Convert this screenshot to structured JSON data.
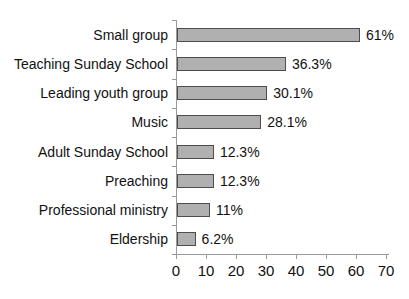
{
  "chart_data": {
    "type": "bar",
    "orientation": "horizontal",
    "title": "",
    "xlabel": "",
    "ylabel": "",
    "categories": [
      "Small group",
      "Teaching Sunday School",
      "Leading youth group",
      "Music",
      "Adult Sunday School",
      "Preaching",
      "Professional ministry",
      "Eldership"
    ],
    "values": [
      61,
      36.3,
      30.1,
      28.1,
      12.3,
      12.3,
      11,
      6.2
    ],
    "value_labels": [
      "61%",
      "36.3%",
      "30.1%",
      "28.1%",
      "12.3%",
      "12.3%",
      "11%",
      "6.2%"
    ],
    "x_ticks": [
      "0",
      "10",
      "20",
      "30",
      "40",
      "50",
      "60",
      "70"
    ],
    "xlim": [
      0,
      70
    ],
    "grid": false,
    "legend": false,
    "colors": {
      "bar_fill": "#b0b0b0",
      "bar_border": "#4d4d4d",
      "axis": "#9a9a9a",
      "text": "#111111",
      "background": "#ffffff"
    }
  }
}
